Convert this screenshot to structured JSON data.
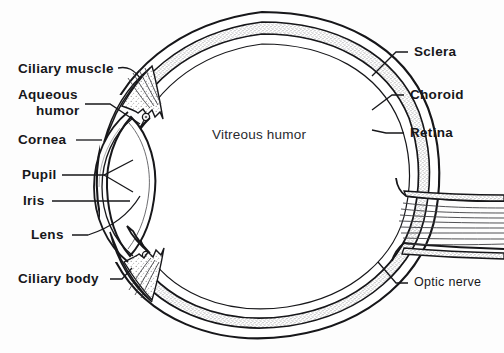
{
  "figure": {
    "background_color": "#fdfdfd",
    "ink_color": "#17171a",
    "stipple_color": "#8d8d90",
    "width": 504,
    "height": 353
  },
  "labels": {
    "ciliary_muscle": "Ciliary muscle",
    "aqueous": "Aqueous",
    "humor": "humor",
    "cornea": "Cornea",
    "pupil": "Pupil",
    "iris": "Iris",
    "lens": "Lens",
    "ciliary_body": "Ciliary body",
    "vitreous_humor": "Vitreous humor",
    "sclera": "Sclera",
    "choroid": "Choroid",
    "retina": "Retina",
    "optic_nerve": "Optic nerve"
  },
  "structures": [
    {
      "id": "ciliary-muscle",
      "name": "Ciliary muscle",
      "side": "left"
    },
    {
      "id": "aqueous-humor",
      "name": "Aqueous humor",
      "side": "left"
    },
    {
      "id": "cornea",
      "name": "Cornea",
      "side": "left"
    },
    {
      "id": "pupil",
      "name": "Pupil",
      "side": "left"
    },
    {
      "id": "iris",
      "name": "Iris",
      "side": "left"
    },
    {
      "id": "lens",
      "name": "Lens",
      "side": "left"
    },
    {
      "id": "ciliary-body",
      "name": "Ciliary body",
      "side": "left"
    },
    {
      "id": "vitreous-humor",
      "name": "Vitreous humor",
      "side": "center"
    },
    {
      "id": "sclera",
      "name": "Sclera",
      "side": "right"
    },
    {
      "id": "choroid",
      "name": "Choroid",
      "side": "right"
    },
    {
      "id": "retina",
      "name": "Retina",
      "side": "right"
    },
    {
      "id": "optic-nerve",
      "name": "Optic nerve",
      "side": "right"
    }
  ]
}
